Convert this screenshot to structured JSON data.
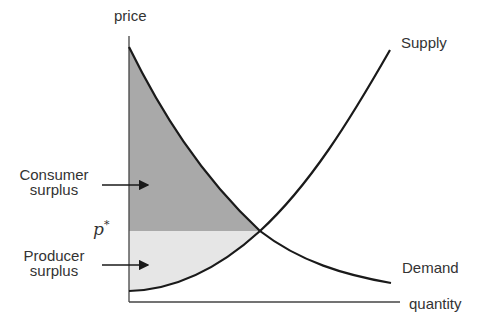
{
  "diagram": {
    "axes": {
      "y_label": "price",
      "x_label": "quantity"
    },
    "curves": {
      "supply_label": "Supply",
      "demand_label": "Demand"
    },
    "equilibrium_price_label": "p*",
    "regions": {
      "consumer_surplus": {
        "line1": "Consumer",
        "line2": "surplus",
        "fill": "#a9a9a9"
      },
      "producer_surplus": {
        "line1": "Producer",
        "line2": "surplus",
        "fill": "#e6e6e6"
      }
    },
    "colors": {
      "curve": "#1a1a1a",
      "axis": "#444444"
    }
  }
}
